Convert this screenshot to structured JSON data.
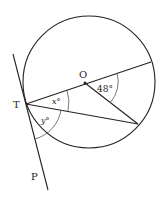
{
  "diagram": {
    "type": "circle-geometry",
    "labels": {
      "center": "O",
      "tangent_point": "T",
      "tangent_end": "P",
      "angle_center": "48°",
      "angle_x": "x°",
      "angle_y": "y°"
    },
    "colors": {
      "stroke": "#222222",
      "background": "#ffffff"
    }
  }
}
